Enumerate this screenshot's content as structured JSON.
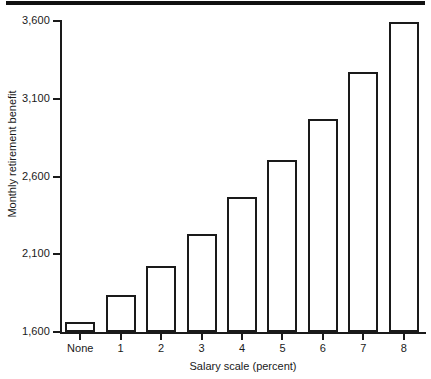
{
  "figure": {
    "top_rule_color": "#111111",
    "background_color": "#ffffff",
    "ink_color": "#1a1a1a"
  },
  "chart_data": {
    "type": "bar",
    "title": "",
    "xlabel": "Salary scale (percent)",
    "ylabel": "Monthly retirement benefit",
    "categories": [
      "None",
      "1",
      "2",
      "3",
      "4",
      "5",
      "6",
      "7",
      "8"
    ],
    "values": [
      1665,
      1838,
      2024,
      2230,
      2468,
      2706,
      2970,
      3272,
      3595
    ],
    "ylim": [
      1600,
      3600
    ],
    "yticks": [
      1600,
      2100,
      2600,
      3100,
      3600
    ],
    "ytick_labels": [
      "1,600",
      "2,100",
      "2,600",
      "3,100",
      "3,600"
    ],
    "grid": false,
    "legend": null,
    "bar_fill": "#ffffff",
    "bar_edge": "#1a1a1a"
  }
}
